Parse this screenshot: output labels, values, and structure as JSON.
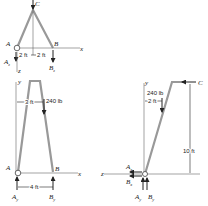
{
  "views": {
    "top": {
      "labels": {
        "A": "A",
        "B": "B",
        "C": "C",
        "x": "x",
        "z": "z",
        "Az": "A",
        "Az_sub": "z",
        "Bz": "B",
        "Bz_sub": "z"
      },
      "dimensions": {
        "left": "2 ft",
        "right": "2 ft"
      }
    },
    "front": {
      "labels": {
        "A": "A",
        "B": "B",
        "x": "x",
        "y": "y",
        "Ay": "A",
        "Ay_sub": "y",
        "By": "B",
        "By_sub": "y"
      },
      "dimensions": {
        "offset": "3 ft",
        "base": "4 ft"
      },
      "load": "240 lb"
    },
    "side": {
      "labels": {
        "C": "C",
        "y": "y",
        "z": "z",
        "Ax": "A",
        "Ax_sub": "x",
        "Bx": "B",
        "Bx_sub": "x",
        "Ay": "A",
        "Ay_sub": "y",
        "By": "B",
        "By_sub": "y"
      },
      "dimensions": {
        "offset": "2 ft",
        "height": "10 ft"
      },
      "load": "240 lb"
    }
  }
}
